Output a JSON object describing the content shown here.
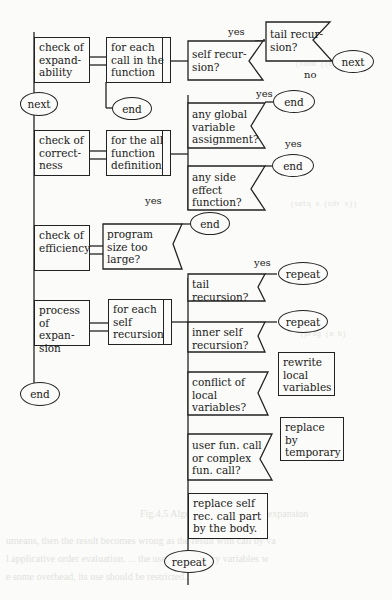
{
  "diagram": {
    "type": "PAD flowchart",
    "colors": {
      "ink": "#222222",
      "paper": "#fbfbf9"
    },
    "main_steps": [
      {
        "id": "expandability",
        "label": "check of\nexpand-\nability"
      },
      {
        "id": "correctness",
        "label": "check of\ncorrect-\nness"
      },
      {
        "id": "efficiency",
        "label": "check of\nefficiency"
      },
      {
        "id": "expansion",
        "label": "process of\nexpan-\nsion"
      }
    ],
    "loops": [
      {
        "id": "each_call",
        "label": "for each\ncall in the\nfunction"
      },
      {
        "id": "all_defs",
        "label": "for the all\nfunction\ndefinition"
      },
      {
        "id": "each_self_rec",
        "label": "for each\nself\nrecursion"
      }
    ],
    "decisions": [
      {
        "id": "self_rec",
        "label": "self recur-\nsion?"
      },
      {
        "id": "tail_rec_1",
        "label": "tail recur-\nsion?"
      },
      {
        "id": "global_assign",
        "label": "any global\nvariable\nassignment?"
      },
      {
        "id": "side_effect",
        "label": "any side\neffect\nfunction?"
      },
      {
        "id": "prog_size",
        "label": "program\n size too\nlarge?"
      },
      {
        "id": "tail_rec_2",
        "label": "tail\nrecursion?"
      },
      {
        "id": "inner_self_rec",
        "label": "inner self\nrecursion?"
      },
      {
        "id": "conflict_local",
        "label": "conflict of\nlocal\nvariables?"
      },
      {
        "id": "user_fun_call",
        "label": "user fun. call\nor complex\nfun. call?"
      }
    ],
    "actions": [
      {
        "id": "rewrite_local",
        "label": "rewrite\nlocal\nvariables"
      },
      {
        "id": "replace_temp",
        "label": "replace by\ntemporary"
      },
      {
        "id": "replace_body",
        "label": "replace self\nrec. call part\nby the body."
      }
    ],
    "terminals": {
      "next_1": "next",
      "next_2": "next",
      "end_1": "end",
      "end_2": "end",
      "end_3": "end",
      "end_4": "end",
      "end_5": "end",
      "repeat_1": "repeat",
      "repeat_2": "repeat",
      "repeat_3": "repeat"
    },
    "branch_labels": {
      "yes_1": "yes",
      "no_1": "no",
      "yes_2": "yes",
      "yes_3": "yes",
      "yes_4": "yes",
      "yes_5": "yes"
    }
  },
  "background_bleed": {
    "caption": "Fig.4.5 Algorithm of procedure expansion",
    "text_lines": [
      "umeans, then the result becomes wrong as the result with call by va",
      "l applicative order evaluation. ... the use of temporary variables w",
      "e some overhead, its use should be restricted."
    ]
  }
}
